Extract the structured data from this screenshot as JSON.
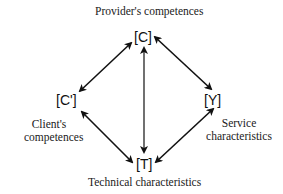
{
  "diagram": {
    "nodes": {
      "provider": {
        "symbol": "[C]",
        "label": "Provider's competences"
      },
      "client": {
        "symbol": "[C']",
        "label_line1": "Client's",
        "label_line2": "competences"
      },
      "service": {
        "symbol": "[Y]",
        "label_line1": "Service",
        "label_line2": "characteristics"
      },
      "technical": {
        "symbol": "[T]",
        "label": "Technical characteristics"
      }
    },
    "edges": [
      {
        "from": "[C]",
        "to": "[C']",
        "type": "bidirectional"
      },
      {
        "from": "[C]",
        "to": "[Y]",
        "type": "bidirectional"
      },
      {
        "from": "[C]",
        "to": "[T]",
        "type": "bidirectional"
      },
      {
        "from": "[C']",
        "to": "[T]",
        "type": "bidirectional"
      },
      {
        "from": "[Y]",
        "to": "[T]",
        "type": "bidirectional"
      }
    ],
    "colors": {
      "line": "#111111",
      "text": "#1a1a1a",
      "background": "#ffffff"
    }
  }
}
